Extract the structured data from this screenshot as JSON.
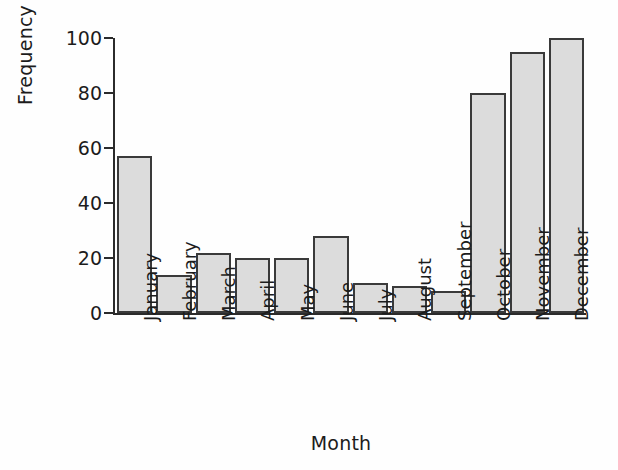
{
  "chart_data": {
    "type": "bar",
    "title": "",
    "xlabel": "Month",
    "ylabel": "Frequency",
    "categories": [
      "January",
      "February",
      "March",
      "April",
      "May",
      "June",
      "July",
      "August",
      "September",
      "October",
      "November",
      "December"
    ],
    "values": [
      57,
      14,
      22,
      20,
      20,
      28,
      11,
      10,
      8,
      80,
      95,
      100
    ],
    "ylim": [
      0,
      100
    ],
    "yticks": [
      0,
      20,
      40,
      60,
      80,
      100
    ],
    "ytick_labels": [
      "0",
      "20",
      "40",
      "60",
      "80",
      "100"
    ],
    "grid": false,
    "legend": false,
    "legend_position": "none",
    "bar_fill_color": "#dcdcdc",
    "bar_edge_color": "#3a3a3a",
    "axis_color": "#2b2b2b",
    "background_color": "#ffffff",
    "xtick_label_rotation": 90
  }
}
